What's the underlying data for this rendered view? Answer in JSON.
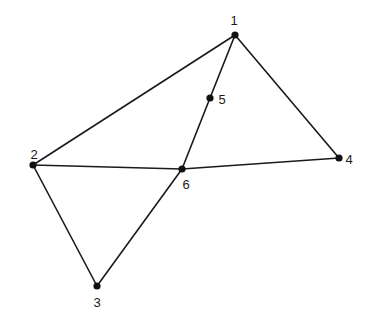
{
  "diagram": {
    "type": "graph",
    "nodes": [
      {
        "id": "1",
        "label": "1",
        "x": 235,
        "y": 35,
        "lx": 234,
        "ly": 25
      },
      {
        "id": "2",
        "label": "2",
        "x": 33,
        "y": 165,
        "lx": 34,
        "ly": 159
      },
      {
        "id": "3",
        "label": "3",
        "x": 97,
        "y": 286,
        "lx": 97,
        "ly": 307
      },
      {
        "id": "4",
        "label": "4",
        "x": 339,
        "y": 158,
        "lx": 349,
        "ly": 164
      },
      {
        "id": "5",
        "label": "5",
        "x": 210,
        "y": 98,
        "lx": 222,
        "ly": 104
      },
      {
        "id": "6",
        "label": "6",
        "x": 182,
        "y": 169,
        "lx": 186,
        "ly": 189
      }
    ],
    "edges": [
      [
        "1",
        "2"
      ],
      [
        "1",
        "5"
      ],
      [
        "5",
        "6"
      ],
      [
        "1",
        "4"
      ],
      [
        "2",
        "6"
      ],
      [
        "6",
        "4"
      ],
      [
        "2",
        "3"
      ],
      [
        "3",
        "6"
      ]
    ],
    "colors": {
      "stroke": "#1a1a1a",
      "node": "#111111",
      "background": "#ffffff"
    }
  }
}
